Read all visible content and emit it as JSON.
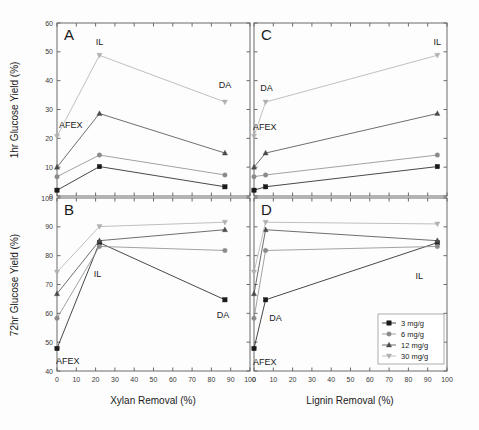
{
  "figure": {
    "axis_titles": {
      "y_top": "1hr Glucose Yield (%)",
      "y_bottom": "72hr Glucose Yield (%)",
      "x_left": "Xylan Removal (%)",
      "x_right": "Lignin Removal (%)"
    },
    "panel_letters": {
      "a": "A",
      "b": "B",
      "c": "C",
      "d": "D"
    },
    "pretreatment_labels": {
      "afex": "AFEX",
      "il": "IL",
      "da": "DA"
    },
    "legend": {
      "title": "",
      "items": [
        {
          "label": "3 mg/g",
          "marker": "square",
          "color": "#1a1a1a"
        },
        {
          "label": "6 mg/g",
          "marker": "circle",
          "color": "#8a8a8a"
        },
        {
          "label": "12 mg/g",
          "marker": "triangle-up",
          "color": "#4a4a4a"
        },
        {
          "label": "30 mg/g",
          "marker": "triangle-down",
          "color": "#b0b0b0"
        }
      ]
    },
    "tick_labels": {
      "x": [
        "0",
        "10",
        "20",
        "30",
        "40",
        "50",
        "60",
        "70",
        "80",
        "90",
        "100"
      ],
      "y_top": [
        "0",
        "10",
        "20",
        "30",
        "40",
        "50",
        "60"
      ],
      "y_bottom": [
        "40",
        "50",
        "60",
        "70",
        "80",
        "90",
        "100"
      ]
    }
  },
  "chart_data": [
    {
      "id": "A",
      "type": "line",
      "title": "A",
      "xlabel": "Xylan Removal (%)",
      "ylabel": "1hr Glucose Yield (%)",
      "xlim": [
        0,
        100
      ],
      "ylim": [
        0,
        60
      ],
      "grid": false,
      "x": [
        0,
        22,
        87
      ],
      "point_labels": [
        "AFEX",
        "IL",
        "DA"
      ],
      "series": [
        {
          "name": "3 mg/g",
          "marker": "square",
          "values": [
            2.0,
            10.2,
            3.2
          ]
        },
        {
          "name": "6 mg/g",
          "marker": "circle",
          "values": [
            6.7,
            14.2,
            7.3
          ]
        },
        {
          "name": "12 mg/g",
          "marker": "triangle-up",
          "values": [
            10.0,
            28.6,
            14.9
          ]
        },
        {
          "name": "30 mg/g",
          "marker": "triangle-down",
          "values": [
            20.7,
            48.8,
            32.6
          ]
        }
      ]
    },
    {
      "id": "B",
      "type": "line",
      "title": "B",
      "xlabel": "Xylan Removal (%)",
      "ylabel": "72hr Glucose Yield (%)",
      "xlim": [
        0,
        100
      ],
      "ylim": [
        40,
        100
      ],
      "grid": false,
      "x": [
        0,
        22,
        87
      ],
      "point_labels": [
        "AFEX",
        "IL",
        "DA"
      ],
      "series": [
        {
          "name": "3 mg/g",
          "marker": "square",
          "values": [
            47.8,
            84.5,
            64.7
          ]
        },
        {
          "name": "6 mg/g",
          "marker": "circle",
          "values": [
            58.3,
            83.2,
            81.8
          ]
        },
        {
          "name": "12 mg/g",
          "marker": "triangle-up",
          "values": [
            66.8,
            85.2,
            89.0
          ]
        },
        {
          "name": "30 mg/g",
          "marker": "triangle-down",
          "values": [
            74.3,
            90.1,
            91.6
          ]
        }
      ]
    },
    {
      "id": "C",
      "type": "line",
      "title": "C",
      "xlabel": "Lignin Removal (%)",
      "ylabel": "1hr Glucose Yield (%)",
      "xlim": [
        0,
        100
      ],
      "ylim": [
        0,
        60
      ],
      "grid": false,
      "x": [
        0,
        6,
        95
      ],
      "point_labels": [
        "AFEX",
        "DA",
        "IL"
      ],
      "series": [
        {
          "name": "3 mg/g",
          "marker": "square",
          "values": [
            2.0,
            3.2,
            10.2
          ]
        },
        {
          "name": "6 mg/g",
          "marker": "circle",
          "values": [
            6.7,
            7.3,
            14.2
          ]
        },
        {
          "name": "12 mg/g",
          "marker": "triangle-up",
          "values": [
            10.0,
            14.9,
            28.6
          ]
        },
        {
          "name": "30 mg/g",
          "marker": "triangle-down",
          "values": [
            20.7,
            32.6,
            48.8
          ]
        }
      ]
    },
    {
      "id": "D",
      "type": "line",
      "title": "D",
      "xlabel": "Lignin Removal (%)",
      "ylabel": "72hr Glucose Yield (%)",
      "xlim": [
        0,
        100
      ],
      "ylim": [
        40,
        100
      ],
      "grid": false,
      "x": [
        0,
        6,
        95
      ],
      "point_labels": [
        "AFEX",
        "DA",
        "IL"
      ],
      "series": [
        {
          "name": "3 mg/g",
          "marker": "square",
          "values": [
            47.8,
            64.7,
            84.5
          ]
        },
        {
          "name": "6 mg/g",
          "marker": "circle",
          "values": [
            58.3,
            81.8,
            83.2
          ]
        },
        {
          "name": "12 mg/g",
          "marker": "triangle-up",
          "values": [
            66.8,
            89.0,
            85.2
          ]
        },
        {
          "name": "30 mg/g",
          "marker": "triangle-down",
          "values": [
            74.3,
            91.6,
            91.0
          ]
        }
      ]
    }
  ]
}
